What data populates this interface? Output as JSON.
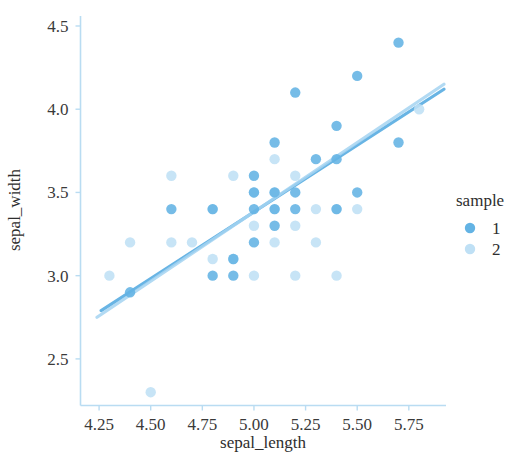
{
  "chart_data": {
    "type": "scatter",
    "title": "",
    "xlabel": "sepal_length",
    "ylabel": "sepal_width",
    "xlim": [
      4.16,
      5.93
    ],
    "ylim": [
      2.22,
      4.56
    ],
    "xticks": [
      "4.25",
      "4.50",
      "4.75",
      "5.00",
      "5.25",
      "5.50",
      "5.75"
    ],
    "xtick_values": [
      4.25,
      4.5,
      4.75,
      5.0,
      5.25,
      5.5,
      5.75
    ],
    "yticks": [
      "2.5",
      "3.0",
      "3.5",
      "4.0",
      "4.5"
    ],
    "ytick_values": [
      2.5,
      3.0,
      3.5,
      4.0,
      4.5
    ],
    "grid": false,
    "legend": {
      "title": "sample",
      "position": "right",
      "entries": [
        {
          "label": "1",
          "color": "#63b3e4"
        },
        {
          "label": "2",
          "color": "#bfe0f5"
        }
      ]
    },
    "series": [
      {
        "name": "1",
        "color": "#63b3e4",
        "points": [
          [
            4.4,
            2.9
          ],
          [
            4.6,
            3.4
          ],
          [
            4.8,
            3.4
          ],
          [
            4.8,
            3.0
          ],
          [
            4.9,
            3.1
          ],
          [
            5.0,
            3.4
          ],
          [
            5.0,
            3.5
          ],
          [
            5.0,
            3.6
          ],
          [
            5.1,
            3.5
          ],
          [
            5.1,
            3.8
          ],
          [
            5.1,
            3.3
          ],
          [
            5.1,
            3.4
          ],
          [
            5.2,
            3.5
          ],
          [
            5.2,
            3.4
          ],
          [
            5.3,
            3.7
          ],
          [
            5.4,
            3.9
          ],
          [
            5.4,
            3.7
          ],
          [
            5.4,
            3.4
          ],
          [
            5.5,
            4.2
          ],
          [
            5.5,
            3.5
          ],
          [
            5.7,
            4.4
          ],
          [
            5.7,
            3.8
          ],
          [
            4.9,
            3.0
          ],
          [
            5.2,
            4.1
          ],
          [
            5.0,
            3.2
          ]
        ]
      },
      {
        "name": "2",
        "color": "#bfe0f5",
        "points": [
          [
            4.3,
            3.0
          ],
          [
            4.4,
            3.2
          ],
          [
            4.5,
            2.3
          ],
          [
            4.6,
            3.6
          ],
          [
            4.6,
            3.2
          ],
          [
            4.7,
            3.2
          ],
          [
            4.8,
            3.1
          ],
          [
            4.9,
            3.1
          ],
          [
            5.0,
            3.0
          ],
          [
            5.0,
            3.3
          ],
          [
            5.1,
            3.7
          ],
          [
            5.1,
            3.5
          ],
          [
            5.1,
            3.4
          ],
          [
            5.2,
            3.0
          ],
          [
            5.2,
            3.3
          ],
          [
            5.3,
            3.4
          ],
          [
            5.4,
            3.4
          ],
          [
            5.4,
            3.0
          ],
          [
            5.5,
            3.4
          ],
          [
            5.8,
            4.0
          ],
          [
            5.2,
            3.6
          ],
          [
            4.9,
            3.6
          ],
          [
            5.3,
            3.2
          ],
          [
            5.1,
            3.2
          ],
          [
            4.8,
            3.4
          ],
          [
            5.0,
            3.5
          ]
        ]
      }
    ],
    "regression_lines": [
      {
        "series": "1",
        "color": "#4ea8e0",
        "x": [
          4.26,
          5.92
        ],
        "y": [
          2.79,
          4.12
        ]
      },
      {
        "series": "2",
        "color": "#a5d4f2",
        "x": [
          4.24,
          5.92
        ],
        "y": [
          2.75,
          4.15
        ]
      }
    ]
  }
}
